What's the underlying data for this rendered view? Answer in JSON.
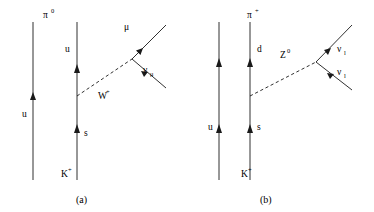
{
  "figure": {
    "type": "feynman-diagram-pair",
    "line_color": "#1a1a1a",
    "background": "#ffffff"
  },
  "diagram_a": {
    "caption": "(a)",
    "meson_in_label": "K",
    "meson_in_sup": "+",
    "meson_out_label": "π",
    "meson_out_sup": "0",
    "spectator_quark": "u",
    "initial_quark": "s",
    "final_quark": "u",
    "boson_label": "W",
    "boson_sup": "+",
    "boson_type": "dashed",
    "lepton_label": "μ",
    "neutrino_label": "ν",
    "neutrino_sub": "μ",
    "geometry": {
      "spectator_x": 33,
      "spectator_y_top": 22,
      "spectator_y_bottom": 180,
      "active_x": 77,
      "active_y_top": 22,
      "active_y_bottom": 180,
      "vertex_quark": [
        77,
        96
      ],
      "vertex_boson": [
        132,
        59
      ],
      "lepton_end": [
        166,
        25
      ],
      "neutrino_end": [
        166,
        88
      ]
    }
  },
  "diagram_b": {
    "caption": "(b)",
    "meson_in_label": "K",
    "meson_in_sup": "+",
    "meson_out_label": "π",
    "meson_out_sup": "+",
    "spectator_quark": "u",
    "initial_quark": "s",
    "final_quark": "d",
    "boson_label": "Z",
    "boson_sup": "0",
    "boson_type": "dashed",
    "neutrino_1_label": "ν",
    "neutrino_1_sub": "l",
    "neutrino_2_label": "ν",
    "neutrino_2_sub": "l",
    "geometry": {
      "spectator_x": 219,
      "spectator_y_top": 22,
      "spectator_y_bottom": 180,
      "active_x": 250,
      "active_y_top": 22,
      "active_y_bottom": 180,
      "vertex_quark": [
        250,
        96
      ],
      "vertex_boson": [
        316,
        62
      ],
      "neutrino_1_end": [
        352,
        25
      ],
      "neutrino_2_end": [
        352,
        90
      ]
    }
  }
}
